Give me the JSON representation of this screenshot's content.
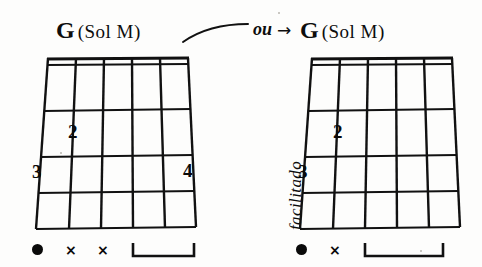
{
  "page": {
    "kind": "guitar-chord-diagram-scan",
    "background_color": "#fdfdfc",
    "ink_color": "#0d0d0d"
  },
  "connector": {
    "word": "ou",
    "arrow": "→"
  },
  "side_note": {
    "text": "facilitado"
  },
  "diagrams": [
    {
      "id": "chord-left",
      "title": {
        "root": "G",
        "qualifier": "(Sol M)"
      },
      "strings": 6,
      "frets": 4,
      "fingerings": [
        {
          "label": "2",
          "string": 5,
          "fret": 2
        },
        {
          "label": "3",
          "string": 6,
          "fret": 3
        },
        {
          "label": "4",
          "string": 1,
          "fret": 3
        }
      ],
      "open_markers": [
        {
          "symbol": "●",
          "name": "root-dot",
          "string": 6
        },
        {
          "symbol": "×",
          "name": "mute-cross",
          "string": 5
        },
        {
          "symbol": "×",
          "name": "mute-cross",
          "string": 4
        }
      ],
      "bracket": {
        "from_string": 3,
        "to_string": 1
      }
    },
    {
      "id": "chord-right",
      "title": {
        "root": "G",
        "qualifier": "(Sol M)"
      },
      "strings": 6,
      "frets": 4,
      "fingerings": [
        {
          "label": "2",
          "string": 5,
          "fret": 2
        },
        {
          "label": "3",
          "string": 6,
          "fret": 3
        }
      ],
      "open_markers": [
        {
          "symbol": "●",
          "name": "root-dot",
          "string": 6
        },
        {
          "symbol": "×",
          "name": "mute-cross",
          "string": 5
        }
      ],
      "bracket": {
        "from_string": 4,
        "to_string": 1
      }
    }
  ]
}
